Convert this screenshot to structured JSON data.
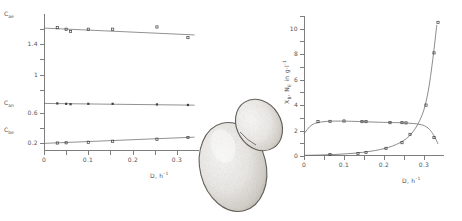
{
  "figure": {
    "illustration": {
      "name": "budding-yeast-cell",
      "caption": ""
    }
  },
  "left_panel": {
    "x_axis": {
      "title_var": "D",
      "title_units": ", h",
      "title_exp": "-1",
      "ticks": [
        "0",
        "0.1",
        "0.2",
        "0.3"
      ]
    },
    "y_axis": {
      "ticks": [
        "1.4",
        "1",
        "0.6",
        "0.2"
      ]
    },
    "series_labels": [
      {
        "sym": "C",
        "sub": "ae"
      },
      {
        "sym": "C",
        "sub": "an"
      },
      {
        "sym": "C",
        "sub": "be"
      }
    ]
  },
  "right_panel": {
    "x_axis": {
      "title_var": "D",
      "title_units": ", h",
      "title_exp": "-1",
      "ticks": [
        "0",
        "0.1",
        "0.2",
        "0.3"
      ]
    },
    "y_axis": {
      "ticks": [
        "10",
        "8",
        "6",
        "4",
        "2",
        "0"
      ],
      "title_a": "X",
      "title_a_sub": "B",
      "title_mid": ", N",
      "title_b_sub": "E",
      "title_tail": " in g·l",
      "title_exp": "-1"
    }
  },
  "chart_data": [
    {
      "type": "scatter",
      "id": "left-chart",
      "title": "",
      "xlabel": "D, h-1",
      "ylabel": "",
      "xlim": [
        0,
        0.35
      ],
      "ylim": [
        0,
        1.8
      ],
      "xticks": [
        0,
        0.1,
        0.2,
        0.3
      ],
      "yticks": [
        0.2,
        0.6,
        1.0,
        1.4
      ],
      "grid": false,
      "legend": "none",
      "series": [
        {
          "name": "C_ae",
          "marker": "open-square",
          "x": [
            0.03,
            0.05,
            0.06,
            0.1,
            0.155,
            0.255,
            0.325
          ],
          "y": [
            1.62,
            1.6,
            1.57,
            1.6,
            1.6,
            1.63,
            1.49
          ],
          "fit": {
            "type": "line",
            "x": [
              0.0,
              0.34
            ],
            "y": [
              1.615,
              1.525
            ]
          }
        },
        {
          "name": "C_an",
          "marker": "filled-square",
          "x": [
            0.03,
            0.05,
            0.06,
            0.1,
            0.155,
            0.255,
            0.325
          ],
          "y": [
            0.625,
            0.62,
            0.615,
            0.62,
            0.62,
            0.612,
            0.605
          ],
          "fit": {
            "type": "line",
            "x": [
              0.0,
              0.34
            ],
            "y": [
              0.625,
              0.602
            ]
          }
        },
        {
          "name": "C_be",
          "marker": "open-square",
          "x": [
            0.03,
            0.05,
            0.1,
            0.155,
            0.255,
            0.325
          ],
          "y": [
            0.105,
            0.108,
            0.115,
            0.128,
            0.155,
            0.178
          ],
          "fit": {
            "type": "line",
            "x": [
              0.0,
              0.34
            ],
            "y": [
              0.1,
              0.182
            ]
          }
        }
      ]
    },
    {
      "type": "scatter",
      "id": "right-chart",
      "title": "",
      "xlabel": "D, h-1",
      "ylabel": "X_B, N_E in g·l-1",
      "xlim": [
        0,
        0.35
      ],
      "ylim": [
        0,
        11
      ],
      "xticks": [
        0,
        0.1,
        0.2,
        0.3
      ],
      "yticks": [
        0,
        2,
        4,
        6,
        8,
        10
      ],
      "grid": false,
      "legend": "none",
      "series": [
        {
          "name": "X_B biomass",
          "marker": "open-square",
          "x": [
            0.035,
            0.065,
            0.1,
            0.145,
            0.155,
            0.215,
            0.245,
            0.255,
            0.325
          ],
          "y": [
            2.7,
            2.72,
            2.75,
            2.7,
            2.7,
            2.62,
            2.62,
            2.6,
            1.45
          ],
          "fit": {
            "type": "curve",
            "x": [
              0.0,
              0.02,
              0.05,
              0.1,
              0.18,
              0.25,
              0.29,
              0.31,
              0.325,
              0.335
            ],
            "y": [
              1.75,
              2.45,
              2.7,
              2.74,
              2.66,
              2.6,
              2.48,
              2.2,
              1.6,
              0.95
            ]
          }
        },
        {
          "name": "N_E substrate",
          "marker": "open-square",
          "x": [
            0.065,
            0.135,
            0.155,
            0.205,
            0.245,
            0.265,
            0.305,
            0.325,
            0.335
          ],
          "y": [
            0.12,
            0.2,
            0.28,
            0.6,
            1.05,
            1.7,
            4.0,
            8.1,
            10.5
          ],
          "fit": {
            "type": "curve",
            "x": [
              0.0,
              0.05,
              0.1,
              0.15,
              0.2,
              0.24,
              0.27,
              0.295,
              0.31,
              0.322,
              0.332
            ],
            "y": [
              0.05,
              0.09,
              0.16,
              0.3,
              0.58,
              1.05,
              1.8,
              3.2,
              5.0,
              7.6,
              10.3
            ]
          }
        }
      ]
    }
  ]
}
